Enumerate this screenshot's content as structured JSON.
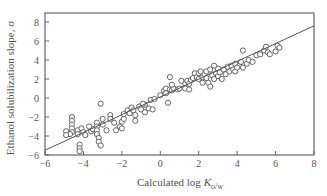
{
  "chart_data": {
    "type": "scatter",
    "title": "",
    "xlabel": "Calculated log K_o/w",
    "xlabel_main": "Calculated log ",
    "xlabel_italic": "K",
    "xlabel_sub": "o/w",
    "ylabel": "Ethanol solubilization slope, σ",
    "xlim": [
      -6,
      8
    ],
    "ylim": [
      -6,
      9
    ],
    "xticks": [
      -6,
      -4,
      -2,
      0,
      2,
      4,
      6,
      8
    ],
    "yticks": [
      -6,
      -4,
      -2,
      0,
      2,
      4,
      6,
      8
    ],
    "xtick_labels": [
      "−6",
      "−4",
      "−2",
      "0",
      "2",
      "4",
      "6",
      "8"
    ],
    "ytick_labels": [
      "−6",
      "−4",
      "−2",
      "0",
      "2",
      "4",
      "6",
      "8"
    ],
    "grid": false,
    "legend": null,
    "regression_line": {
      "x": [
        -6,
        8
      ],
      "y": [
        -5.5,
        7.6
      ]
    },
    "series": [
      {
        "name": "compounds",
        "marker": "open-circle",
        "points": [
          [
            -4.6,
            -2.0
          ],
          [
            -4.6,
            -2.4
          ],
          [
            -4.6,
            -2.8
          ],
          [
            -4.6,
            -3.2
          ],
          [
            -4.6,
            -3.6
          ],
          [
            -4.7,
            -3.8
          ],
          [
            -4.9,
            -3.5
          ],
          [
            -4.9,
            -3.9
          ],
          [
            -4.3,
            -3.4
          ],
          [
            -4.3,
            -3.8
          ],
          [
            -4.1,
            -3.2
          ],
          [
            -4.0,
            -3.6
          ],
          [
            -3.9,
            -3.9
          ],
          [
            -3.7,
            -3.0
          ],
          [
            -3.6,
            -3.5
          ],
          [
            -4.2,
            -4.9
          ],
          [
            -4.2,
            -5.3
          ],
          [
            -4.2,
            -5.6
          ],
          [
            -3.5,
            -3.3
          ],
          [
            -3.3,
            -2.6
          ],
          [
            -3.3,
            -3.0
          ],
          [
            -3.3,
            -3.4
          ],
          [
            -3.3,
            -3.8
          ],
          [
            -3.2,
            -4.2
          ],
          [
            -3.2,
            -4.6
          ],
          [
            -3.1,
            -5.0
          ],
          [
            -3.0,
            -2.2
          ],
          [
            -3.0,
            -2.8
          ],
          [
            -2.8,
            -3.4
          ],
          [
            -3.1,
            -0.6
          ],
          [
            -2.6,
            -1.8
          ],
          [
            -2.6,
            -2.2
          ],
          [
            -2.4,
            -2.6
          ],
          [
            -2.3,
            -3.4
          ],
          [
            -2.1,
            -3.0
          ],
          [
            -2.0,
            -3.2
          ],
          [
            -2.0,
            -2.5
          ],
          [
            -1.9,
            -1.7
          ],
          [
            -1.9,
            -2.2
          ],
          [
            -1.7,
            -1.3
          ],
          [
            -1.6,
            -1.6
          ],
          [
            -1.5,
            -1.0
          ],
          [
            -1.4,
            -1.3
          ],
          [
            -1.3,
            -1.8
          ],
          [
            -1.3,
            -2.4
          ],
          [
            -1.1,
            -0.9
          ],
          [
            -1.0,
            -1.2
          ],
          [
            -0.8,
            -0.7
          ],
          [
            -0.5,
            -0.2
          ],
          [
            -0.3,
            -0.1
          ],
          [
            -0.6,
            -1.1
          ],
          [
            -0.8,
            -1.5
          ],
          [
            -0.4,
            -1.2
          ],
          [
            0.0,
            0.3
          ],
          [
            0.2,
            0.8
          ],
          [
            0.3,
            1.0
          ],
          [
            0.3,
            0.5
          ],
          [
            0.5,
            0.9
          ],
          [
            0.6,
            0.8
          ],
          [
            0.7,
            1.0
          ],
          [
            0.5,
            2.2
          ],
          [
            0.6,
            1.4
          ],
          [
            0.4,
            -0.5
          ],
          [
            0.9,
            0.9
          ],
          [
            1.0,
            1.0
          ],
          [
            1.1,
            1.8
          ],
          [
            1.3,
            1.5
          ],
          [
            1.3,
            1.0
          ],
          [
            1.4,
            1.8
          ],
          [
            1.5,
            1.5
          ],
          [
            1.6,
            1.9
          ],
          [
            1.7,
            2.1
          ],
          [
            1.8,
            2.6
          ],
          [
            1.9,
            2.2
          ],
          [
            2.0,
            2.0
          ],
          [
            2.0,
            2.6
          ],
          [
            2.1,
            2.8
          ],
          [
            2.2,
            2.2
          ],
          [
            2.2,
            1.6
          ],
          [
            2.3,
            2.5
          ],
          [
            2.4,
            2.1
          ],
          [
            2.4,
            2.8
          ],
          [
            2.5,
            1.6
          ],
          [
            2.6,
            1.2
          ],
          [
            2.6,
            3.0
          ],
          [
            2.7,
            2.4
          ],
          [
            2.8,
            2.0
          ],
          [
            2.9,
            2.6
          ],
          [
            3.0,
            3.1
          ],
          [
            3.0,
            2.3
          ],
          [
            3.1,
            2.7
          ],
          [
            3.2,
            2.0
          ],
          [
            3.3,
            3.0
          ],
          [
            3.4,
            2.5
          ],
          [
            3.5,
            3.3
          ],
          [
            3.6,
            2.8
          ],
          [
            3.7,
            3.4
          ],
          [
            3.8,
            3.0
          ],
          [
            3.9,
            3.6
          ],
          [
            3.9,
            2.8
          ],
          [
            4.1,
            3.4
          ],
          [
            4.2,
            3.8
          ],
          [
            4.3,
            5.0
          ],
          [
            4.3,
            3.2
          ],
          [
            4.5,
            3.6
          ],
          [
            4.6,
            4.0
          ],
          [
            4.8,
            3.8
          ],
          [
            5.0,
            4.5
          ],
          [
            5.2,
            4.6
          ],
          [
            5.4,
            5.0
          ],
          [
            5.5,
            5.4
          ],
          [
            5.6,
            4.8
          ],
          [
            5.7,
            4.6
          ],
          [
            6.0,
            4.9
          ],
          [
            6.1,
            5.5
          ],
          [
            6.2,
            5.3
          ],
          [
            4.0,
            3.2
          ],
          [
            2.8,
            3.4
          ],
          [
            1.5,
            0.9
          ],
          [
            -0.9,
            -0.6
          ]
        ]
      }
    ]
  }
}
